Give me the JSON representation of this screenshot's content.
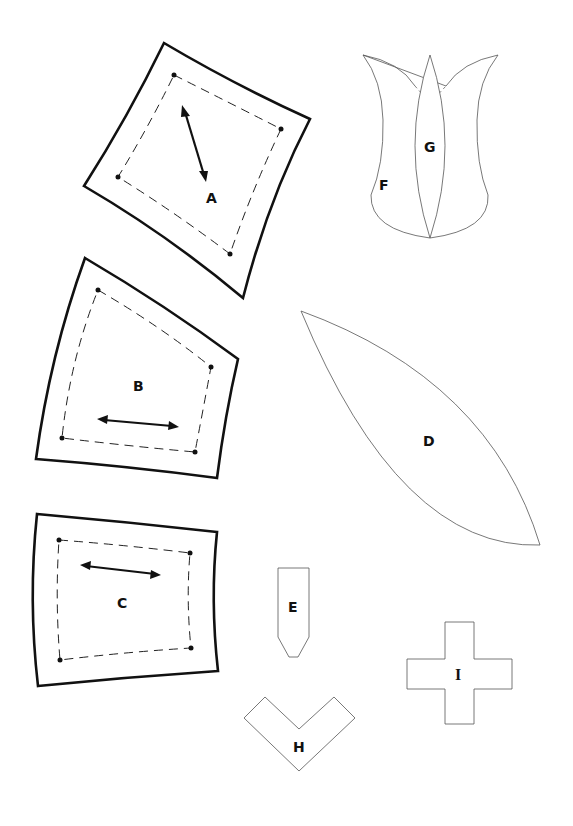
{
  "diagram": {
    "pieces": [
      {
        "id": "A",
        "label": "A",
        "type": "curved quadrilateral with seam allowance and grain arrow"
      },
      {
        "id": "B",
        "label": "B",
        "type": "curved quadrilateral with seam allowance and grain arrow"
      },
      {
        "id": "C",
        "label": "C",
        "type": "curved quadrilateral with seam allowance and grain arrow"
      },
      {
        "id": "D",
        "label": "D",
        "type": "leaf shape"
      },
      {
        "id": "E",
        "label": "E",
        "type": "stem tip shape"
      },
      {
        "id": "F",
        "label": "F",
        "type": "tulip outer petals"
      },
      {
        "id": "G",
        "label": "G",
        "type": "tulip center petal"
      },
      {
        "id": "H",
        "label": "H",
        "type": "chevron shape"
      },
      {
        "id": "I",
        "label": "I",
        "type": "cross shape"
      }
    ]
  }
}
